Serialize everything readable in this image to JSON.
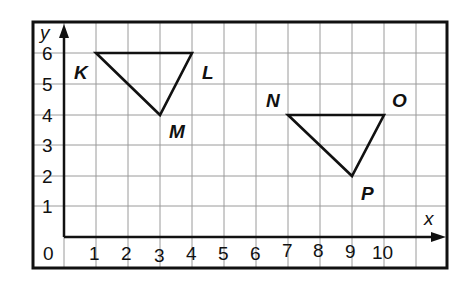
{
  "diagram": {
    "type": "coordinate-grid",
    "axes": {
      "x_label": "x",
      "y_label": "y",
      "x_ticks": [
        "1",
        "2",
        "3",
        "4",
        "5",
        "6",
        "7",
        "8",
        "9",
        "10"
      ],
      "y_ticks": [
        "1",
        "2",
        "3",
        "4",
        "5",
        "6"
      ],
      "origin_label": "0",
      "x_range": [
        0,
        11
      ],
      "y_range": [
        0,
        7
      ]
    },
    "triangles": [
      {
        "name": "KLM",
        "vertices": [
          {
            "label": "K",
            "x": 1,
            "y": 6
          },
          {
            "label": "L",
            "x": 4,
            "y": 6
          },
          {
            "label": "M",
            "x": 3,
            "y": 4
          }
        ]
      },
      {
        "name": "NOP",
        "vertices": [
          {
            "label": "N",
            "x": 7,
            "y": 4
          },
          {
            "label": "O",
            "x": 10,
            "y": 4
          },
          {
            "label": "P",
            "x": 9,
            "y": 2
          }
        ]
      }
    ],
    "colors": {
      "line": "#111111",
      "grid": "#9a9a9a",
      "background": "#ffffff"
    }
  }
}
